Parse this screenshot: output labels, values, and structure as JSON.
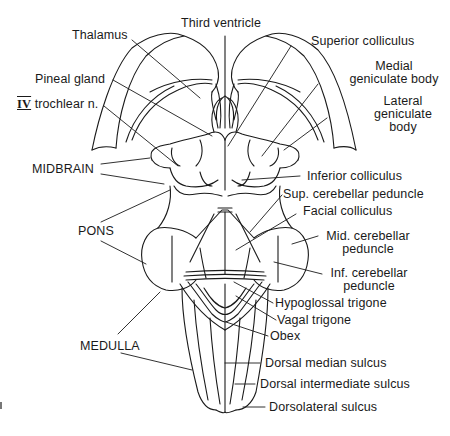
{
  "figure": {
    "labels": {
      "third_ventricle": "Third ventricle",
      "thalamus": "Thalamus",
      "pineal_gland": "Pineal gland",
      "trochlear_numeral": "IV",
      "trochlear": "trochlear n.",
      "superior_colliculus": "Superior colliculus",
      "medial_geniculate_1": "Medial",
      "medial_geniculate_2": "geniculate body",
      "lateral_geniculate_1": "Lateral",
      "lateral_geniculate_2": "geniculate",
      "lateral_geniculate_3": "body",
      "midbrain": "MIDBRAIN",
      "inferior_colliculus": "Inferior colliculus",
      "sup_cerebellar_peduncle": "Sup. cerebellar peduncle",
      "facial_colliculus": "Facial colliculus",
      "pons": "PONS",
      "mid_cerebellar_peduncle_1": "Mid. cerebellar",
      "mid_cerebellar_peduncle_2": "peduncle",
      "inf_cerebellar_peduncle_1": "Inf. cerebellar",
      "inf_cerebellar_peduncle_2": "peduncle",
      "hypoglossal_trigone": "Hypoglossal trigone",
      "vagal_trigone": "Vagal trigone",
      "obex": "Obex",
      "medulla": "MEDULLA",
      "dorsal_median_sulcus": "Dorsal median sulcus",
      "dorsal_intermediate_sulcus": "Dorsal intermediate sulcus",
      "dorsolateral_sulcus": "Dorsolateral sulcus"
    },
    "colors": {
      "line": "#1a1a1a",
      "background": "#ffffff"
    }
  }
}
